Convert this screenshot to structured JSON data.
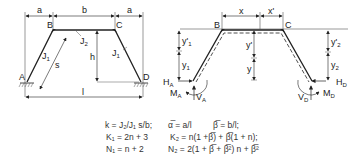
{
  "left_diagram": {
    "labels": {
      "dim_a_left": "a",
      "dim_b": "b",
      "dim_a_right": "a",
      "node_A": "A",
      "node_B": "B",
      "node_C": "C",
      "node_D": "D",
      "J2": "J",
      "J2_sub": "2",
      "J1_left": "J",
      "J1_left_sub": "1",
      "J1_right": "J",
      "J1_right_sub": "1",
      "s": "s",
      "h": "h",
      "l": "l"
    }
  },
  "right_diagram": {
    "labels": {
      "node_B": "B",
      "node_C": "C",
      "x": "x",
      "x_prime": "x'",
      "y_prime": "y'",
      "y": "y",
      "y1_prime": "y'",
      "y1_prime_sub": "1",
      "y1": "y",
      "y1_sub": "1",
      "y2_prime": "y'",
      "y2_prime_sub": "2",
      "y2": "y",
      "y2_sub": "2",
      "HA": "H",
      "HA_sub": "A",
      "MA": "M",
      "MA_sub": "A",
      "VA": "V",
      "VA_sub": "A",
      "HD": "H",
      "HD_sub": "D",
      "MD": "M",
      "MD_sub": "D",
      "VD": "V",
      "VD_sub": "D"
    }
  },
  "formulas": {
    "row1_left": "k = J₂/J₁ s/b;",
    "row1_mid": "α̅ = a/l",
    "row1_right": "β̅ = b/l;",
    "row2_left": "K₁ = 2n + 3",
    "row2_right": "K₂ = n(1 +β̅) + β̅(1 + n);",
    "row3_left": "N₁ = n + 2",
    "row3_right": "N₂ = 2(1 + β̅ + β̅²) n + β̅²"
  }
}
